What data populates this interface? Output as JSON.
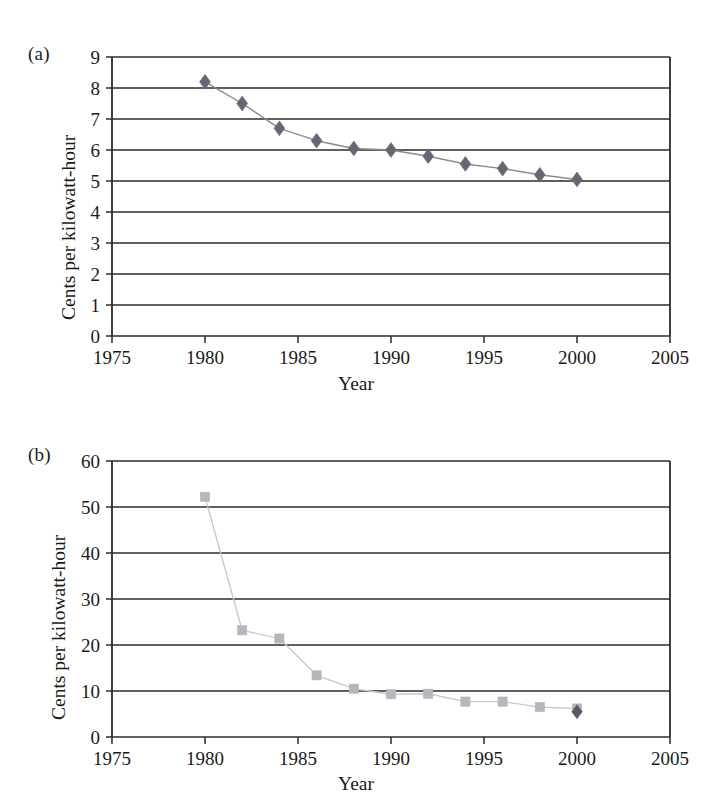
{
  "figure": {
    "background": "#ffffff",
    "panels": [
      {
        "id": "a",
        "label": "(a)",
        "ylabel": "Cents per kilowatt-hour",
        "xlabel": "Year"
      },
      {
        "id": "b",
        "label": "(b)",
        "ylabel": "Cents per kilowatt-hour",
        "xlabel": "Year"
      }
    ]
  },
  "chart_data": [
    {
      "type": "line",
      "panel": "a",
      "title": "",
      "xlabel": "Year",
      "ylabel": "Cents per kilowatt-hour",
      "xlim": [
        1975,
        2005
      ],
      "ylim": [
        0,
        9
      ],
      "xticks": [
        1975,
        1980,
        1985,
        1990,
        1995,
        2000,
        2005
      ],
      "xticklabels": [
        "1975",
        "1980",
        "1985",
        "1990",
        "1995",
        "2000",
        "2005"
      ],
      "yticks": [
        0,
        1,
        2,
        3,
        4,
        5,
        6,
        7,
        8,
        9
      ],
      "yticklabels": [
        "0",
        "1",
        "2",
        "3",
        "4",
        "5",
        "6",
        "7",
        "8",
        "9"
      ],
      "grid": "horizontal",
      "legend": "none",
      "marker": "diamond",
      "marker_color": "#6b6473",
      "line_color": "#8d8894",
      "series": [
        {
          "name": "",
          "x": [
            1980,
            1982,
            1984,
            1986,
            1988,
            1990,
            1992,
            1994,
            1996,
            1998,
            2000
          ],
          "values": [
            8.2,
            7.5,
            6.7,
            6.3,
            6.05,
            6.0,
            5.8,
            5.55,
            5.4,
            5.2,
            5.05
          ]
        }
      ]
    },
    {
      "type": "line",
      "panel": "b",
      "title": "",
      "xlabel": "Year",
      "ylabel": "Cents per kilowatt-hour",
      "xlim": [
        1975,
        2005
      ],
      "ylim": [
        0,
        60
      ],
      "xticks": [
        1975,
        1980,
        1985,
        1990,
        1995,
        2000,
        2005
      ],
      "xticklabels": [
        "1975",
        "1980",
        "1985",
        "1990",
        "1995",
        "2000",
        "2005"
      ],
      "yticks": [
        0,
        10,
        20,
        30,
        40,
        50,
        60
      ],
      "yticklabels": [
        "0",
        "10",
        "20",
        "30",
        "40",
        "50",
        "60"
      ],
      "grid": "horizontal",
      "legend": "none",
      "marker": "square",
      "marker_color": "#b9b4bd",
      "line_color": "#cbc7d0",
      "series": [
        {
          "name": "",
          "x": [
            1980,
            1982,
            1984,
            1986,
            1988,
            1990,
            1992,
            1994,
            1996,
            1998,
            2000
          ],
          "values": [
            52.2,
            23.2,
            21.4,
            13.4,
            10.5,
            9.3,
            9.4,
            7.7,
            7.7,
            6.5,
            6.2
          ]
        },
        {
          "name": "",
          "x": [
            2000
          ],
          "values": [
            5.5
          ]
        }
      ]
    }
  ]
}
